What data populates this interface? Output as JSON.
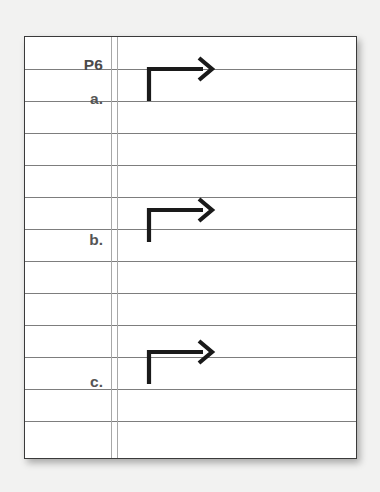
{
  "document": {
    "kind": "ruled-notebook-page",
    "page_label": "P6",
    "background_color": "#f2f2f1",
    "paper_color": "#ffffff",
    "border_color": "#3a3a3a",
    "rule_color": "#7d7d7d",
    "margin_rule_color": "#a8a8a8",
    "ink_color": "#1a1a1a",
    "label_color": "#555555"
  },
  "margin_labels": [
    {
      "id": "page-number",
      "text": "P6",
      "y": 56
    },
    {
      "id": "item-a",
      "text": "a.",
      "y": 90
    },
    {
      "id": "item-b",
      "text": "b.",
      "y": 231
    },
    {
      "id": "item-c",
      "text": "c.",
      "y": 373
    }
  ],
  "ruled_lines": {
    "count": 12,
    "first_y": 68,
    "spacing": 32,
    "y_positions": [
      68,
      100,
      132,
      164,
      196,
      228,
      260,
      292,
      324,
      356,
      388,
      420
    ]
  },
  "margin_rules": {
    "count": 2,
    "x_positions": [
      110,
      116
    ]
  },
  "marks": [
    {
      "id": "arrow-a",
      "glyph": "right-turn-arrow",
      "row_label": "a.",
      "corner_x": 148,
      "top_y": 68,
      "bottom_y": 100,
      "tip_x": 211
    },
    {
      "id": "arrow-b",
      "glyph": "right-turn-arrow",
      "row_label": "b.",
      "corner_x": 148,
      "top_y": 209,
      "bottom_y": 241,
      "tip_x": 211
    },
    {
      "id": "arrow-c",
      "glyph": "right-turn-arrow",
      "row_label": "c.",
      "corner_x": 148,
      "top_y": 351,
      "bottom_y": 383,
      "tip_x": 211
    }
  ]
}
